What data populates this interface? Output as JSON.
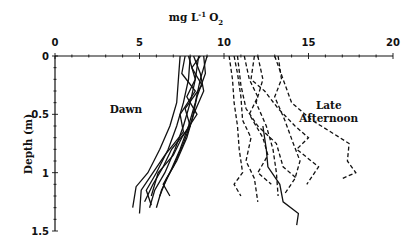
{
  "chart_data": {
    "type": "line",
    "title": "",
    "xlabel": "mg L-1 O2",
    "xlabel_parts": {
      "main": "mg L",
      "sup": "-1",
      "O": "O",
      "sub": "2"
    },
    "ylabel": "Depth (m)",
    "xlim": [
      0,
      20
    ],
    "ylim": [
      1.5,
      0
    ],
    "x_axis_position": "top",
    "y_axis_inverted": true,
    "xticks": [
      "0",
      "5",
      "10",
      "15",
      "20"
    ],
    "yticks": [
      "0",
      "0.5",
      "1",
      "1.5"
    ],
    "grid": false,
    "annotations": [
      {
        "text": "Dawn",
        "x": 4.2,
        "y": 0.45
      },
      {
        "text": "Late",
        "x": 16.2,
        "y": 0.42
      },
      {
        "text": "Afternoon",
        "x": 16.2,
        "y": 0.53
      }
    ],
    "series": [
      {
        "name": "Dawn",
        "style": "solid",
        "profiles": [
          [
            [
              7.4,
              0
            ],
            [
              7.3,
              0.2
            ],
            [
              7.2,
              0.4
            ],
            [
              6.8,
              0.6
            ],
            [
              6.2,
              0.8
            ],
            [
              5.5,
              1.0
            ],
            [
              4.8,
              1.12
            ],
            [
              4.6,
              1.3
            ]
          ],
          [
            [
              8.0,
              0
            ],
            [
              7.9,
              0.2
            ],
            [
              7.6,
              0.4
            ],
            [
              7.2,
              0.6
            ],
            [
              6.7,
              0.8
            ],
            [
              6.0,
              1.0
            ],
            [
              5.4,
              1.15
            ],
            [
              5.7,
              1.28
            ]
          ],
          [
            [
              8.5,
              0
            ],
            [
              8.3,
              0.2
            ],
            [
              8.0,
              0.4
            ],
            [
              7.6,
              0.6
            ],
            [
              7.1,
              0.8
            ],
            [
              6.5,
              1.0
            ],
            [
              5.9,
              1.15
            ],
            [
              5.6,
              1.3
            ]
          ],
          [
            [
              9.0,
              0
            ],
            [
              8.6,
              0.2
            ],
            [
              8.3,
              0.4
            ],
            [
              7.9,
              0.6
            ],
            [
              7.4,
              0.8
            ],
            [
              6.8,
              1.0
            ],
            [
              6.3,
              1.15
            ],
            [
              6.0,
              1.3
            ]
          ],
          [
            [
              8.8,
              0
            ],
            [
              8.9,
              0.15
            ],
            [
              8.4,
              0.35
            ],
            [
              8.1,
              0.55
            ],
            [
              7.6,
              0.75
            ],
            [
              7.0,
              0.95
            ],
            [
              6.4,
              1.1
            ],
            [
              6.8,
              1.2
            ]
          ],
          [
            [
              8.2,
              0
            ],
            [
              8.6,
              0.15
            ],
            [
              8.8,
              0.3
            ],
            [
              8.2,
              0.5
            ],
            [
              7.8,
              0.7
            ],
            [
              7.2,
              0.9
            ],
            [
              6.6,
              1.05
            ],
            [
              6.2,
              1.2
            ]
          ],
          [
            [
              7.9,
              0
            ],
            [
              8.3,
              0.2
            ],
            [
              7.8,
              0.35
            ],
            [
              8.4,
              0.5
            ],
            [
              7.5,
              0.7
            ],
            [
              7.0,
              0.85
            ],
            [
              6.1,
              1.0
            ],
            [
              5.7,
              1.2
            ]
          ],
          [
            [
              8.6,
              0
            ],
            [
              8.1,
              0.1
            ],
            [
              8.7,
              0.25
            ],
            [
              7.7,
              0.45
            ],
            [
              8.0,
              0.6
            ],
            [
              6.9,
              0.8
            ],
            [
              6.4,
              0.95
            ],
            [
              5.8,
              1.1
            ],
            [
              5.3,
              1.25
            ]
          ],
          [
            [
              7.7,
              0
            ],
            [
              7.5,
              0.15
            ],
            [
              8.3,
              0.3
            ],
            [
              7.4,
              0.5
            ],
            [
              7.6,
              0.65
            ],
            [
              6.5,
              0.85
            ],
            [
              5.8,
              1.0
            ],
            [
              5.1,
              1.15
            ],
            [
              5.0,
              1.35
            ]
          ]
        ]
      },
      {
        "name": "Late Afternoon",
        "style": "dashed",
        "profiles": [
          [
            [
              10.3,
              0
            ],
            [
              10.5,
              0.2
            ],
            [
              10.6,
              0.4
            ],
            [
              10.8,
              0.6
            ],
            [
              10.9,
              0.8
            ],
            [
              11.1,
              1.0
            ],
            [
              10.6,
              1.1
            ],
            [
              11.0,
              1.2
            ]
          ],
          [
            [
              10.6,
              0
            ],
            [
              10.8,
              0.15
            ],
            [
              11.0,
              0.35
            ],
            [
              11.1,
              0.55
            ],
            [
              11.6,
              0.7
            ],
            [
              11.3,
              0.9
            ],
            [
              11.8,
              1.05
            ],
            [
              12.0,
              1.25
            ]
          ],
          [
            [
              11.2,
              0
            ],
            [
              11.5,
              0.2
            ],
            [
              12.0,
              0.35
            ],
            [
              11.5,
              0.5
            ],
            [
              12.3,
              0.7
            ],
            [
              12.6,
              0.85
            ],
            [
              12.0,
              1.0
            ],
            [
              12.8,
              1.1
            ]
          ],
          [
            [
              12.0,
              0
            ],
            [
              12.3,
              0.2
            ],
            [
              11.9,
              0.4
            ],
            [
              12.5,
              0.6
            ],
            [
              12.9,
              0.8
            ],
            [
              13.1,
              1.0
            ],
            [
              13.2,
              1.2
            ]
          ],
          [
            [
              13.2,
              0
            ],
            [
              13.4,
              0.2
            ],
            [
              13.0,
              0.35
            ],
            [
              13.6,
              0.55
            ],
            [
              14.1,
              0.75
            ],
            [
              14.5,
              0.9
            ],
            [
              14.2,
              1.05
            ],
            [
              13.6,
              1.18
            ]
          ],
          [
            [
              11.8,
              0
            ],
            [
              11.6,
              0.2
            ],
            [
              12.4,
              0.3
            ],
            [
              13.2,
              0.45
            ],
            [
              14.2,
              0.6
            ],
            [
              15.0,
              0.7
            ],
            [
              14.3,
              0.8
            ],
            [
              15.6,
              0.95
            ],
            [
              14.9,
              1.1
            ]
          ],
          [
            [
              13.0,
              0
            ],
            [
              13.5,
              0.2
            ],
            [
              14.0,
              0.4
            ],
            [
              15.2,
              0.55
            ],
            [
              16.3,
              0.65
            ],
            [
              17.4,
              0.75
            ],
            [
              17.3,
              0.9
            ],
            [
              17.8,
              1.0
            ],
            [
              17.0,
              1.05
            ]
          ],
          [
            [
              10.8,
              0
            ],
            [
              11.0,
              0.25
            ],
            [
              11.3,
              0.45
            ],
            [
              12.0,
              0.6
            ],
            [
              13.1,
              0.75
            ],
            [
              13.5,
              0.95
            ],
            [
              14.3,
              1.05
            ]
          ]
        ]
      },
      {
        "name": "Afternoon (solid trailing)",
        "style": "solid",
        "profiles": [
          [
            [
              12.3,
              0.6
            ],
            [
              12.5,
              0.8
            ],
            [
              12.6,
              0.95
            ],
            [
              13.3,
              1.1
            ],
            [
              13.5,
              1.25
            ],
            [
              14.4,
              1.35
            ],
            [
              14.3,
              1.45
            ]
          ]
        ]
      }
    ]
  }
}
